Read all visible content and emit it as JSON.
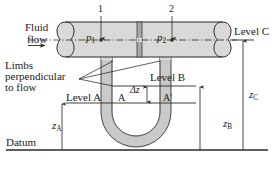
{
  "figure": {
    "type": "engineering-diagram",
    "background_color": "#ffffff",
    "line_color": "#2a2a2a",
    "pipe_fill_color": "#d9d9d7",
    "plate_fill_color": "#a8a8a6",
    "tube_wall_color": "#c9c9c7"
  },
  "labels": {
    "fluid_line1": "Fluid",
    "fluid_line2": "flow",
    "limbs_line1": "Limbs",
    "limbs_line2": "perpendicular",
    "limbs_line3": "to flow",
    "tap1": "1",
    "tap2": "2",
    "p1": "p",
    "p1_sub": "1",
    "p2": "p",
    "p2_sub": "2",
    "level_a": "Level A",
    "level_b": "Level B",
    "level_c": "Level C",
    "point_a": "A",
    "point_a_prime": "A'",
    "delta_z": "Δz",
    "z_a": "z",
    "z_a_sub": "A",
    "z_b": "z",
    "z_b_sub": "B",
    "z_c": "z",
    "z_c_sub": "C",
    "datum": "Datum"
  },
  "geometry": {
    "pipe_top_y": 22,
    "pipe_bottom_y": 57,
    "pipe_centerline_y": 40,
    "pipe_left_x": 60,
    "pipe_right_x": 228,
    "orifice_plate_x": 139,
    "tap1_x": 101,
    "tap2_x": 172,
    "level_a_y": 103,
    "level_b_y": 86,
    "level_c_y": 40,
    "datum_y": 150,
    "utube_left_x": 106,
    "utube_right_x": 166,
    "z_a_arrow_x": 62,
    "z_b_arrow_x": 200,
    "z_c_arrow_x": 243
  }
}
